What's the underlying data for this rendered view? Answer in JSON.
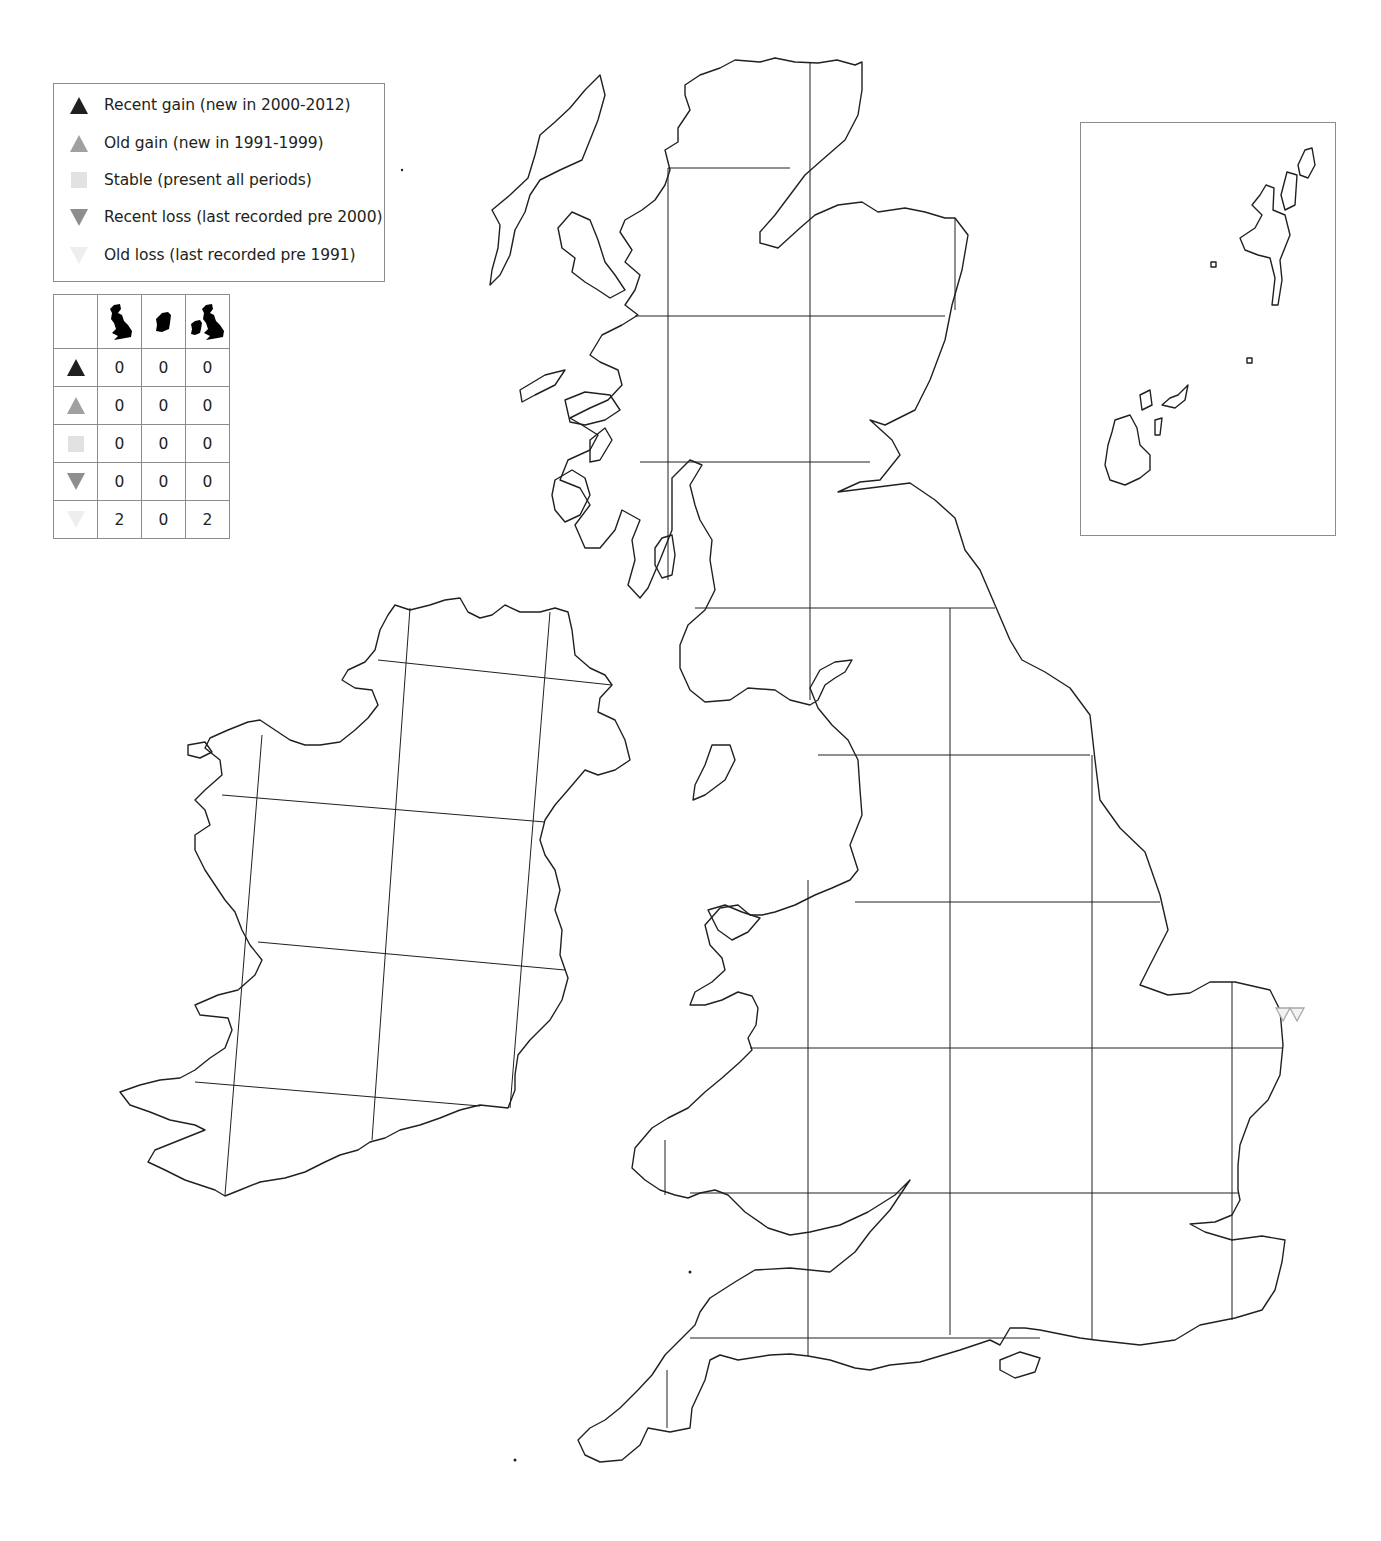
{
  "legend": {
    "items": [
      {
        "key": "recent_gain",
        "label": "Recent gain (new in 2000-2012)",
        "symbol": "triangle-up",
        "color": "#231f20"
      },
      {
        "key": "old_gain",
        "label": "Old gain (new in 1991-1999)",
        "symbol": "triangle-up",
        "color": "#a0a0a0"
      },
      {
        "key": "stable",
        "label": "Stable (present all periods)",
        "symbol": "square",
        "color": "#e2e2e2"
      },
      {
        "key": "recent_loss",
        "label": "Recent loss (last recorded pre 2000)",
        "symbol": "triangle-down",
        "color": "#8e8e8e"
      },
      {
        "key": "old_loss",
        "label": "Old loss (last recorded pre 1991)",
        "symbol": "triangle-down",
        "color": "#eeeeee"
      }
    ]
  },
  "count_table": {
    "columns": [
      {
        "key": "britain",
        "icon": "great-britain-silhouette"
      },
      {
        "key": "ireland",
        "icon": "ireland-silhouette"
      },
      {
        "key": "britain_and_ireland",
        "icon": "britain-and-ireland-silhouette"
      }
    ],
    "rows": [
      {
        "key": "recent_gain",
        "values": [
          "0",
          "0",
          "0"
        ]
      },
      {
        "key": "old_gain",
        "values": [
          "0",
          "0",
          "0"
        ]
      },
      {
        "key": "stable",
        "values": [
          "0",
          "0",
          "0"
        ]
      },
      {
        "key": "recent_loss",
        "values": [
          "0",
          "0",
          "0"
        ]
      },
      {
        "key": "old_loss",
        "values": [
          "2",
          "0",
          "2"
        ]
      }
    ]
  },
  "map": {
    "region": "Britain and Ireland",
    "inset": "Orkney and Shetland",
    "records": [
      {
        "status": "old_loss",
        "location": "East Norfolk coast"
      },
      {
        "status": "old_loss",
        "location": "East Norfolk coast"
      }
    ],
    "colors": {
      "coastline": "#231f20",
      "grid": "#231f20",
      "old_loss": "#c8c8c8"
    }
  }
}
